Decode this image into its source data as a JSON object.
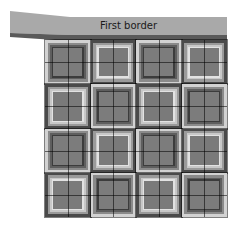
{
  "banner": {
    "label": "First border",
    "fill": "#a9a9a9",
    "edge": "#5a5a5a"
  },
  "quilt": {
    "rows": 4,
    "cols": 4,
    "layout": [
      [
        "A",
        "B",
        "A",
        "B"
      ],
      [
        "B",
        "A",
        "B",
        "A"
      ],
      [
        "A",
        "B",
        "A",
        "B"
      ],
      [
        "B",
        "A",
        "B",
        "A"
      ]
    ],
    "block_types": {
      "A": {
        "description": "light outer ring, dark inner rings, medium center",
        "rings": [
          "#d2d2d2",
          "#8a8a8a",
          "#5e5e5e",
          "#3c3c3c",
          "#7c7c7c"
        ]
      },
      "B": {
        "description": "dark outer ring, light inner ring, medium center",
        "rings": [
          "#4a4a4a",
          "#9a9a9a",
          "#c8c8c8",
          "#e2e2e2",
          "#7a7a7a"
        ]
      }
    }
  }
}
